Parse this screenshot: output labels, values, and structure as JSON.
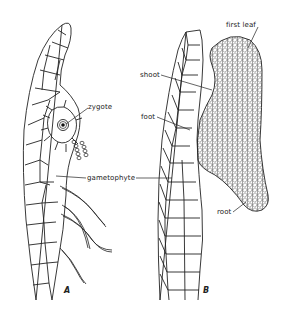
{
  "figure": {
    "title": "",
    "panels": [
      {
        "id": "A",
        "label": "A"
      },
      {
        "id": "B",
        "label": "B"
      }
    ],
    "labels": {
      "zygote": "zygote",
      "gametophyte": "gametophyte",
      "shoot": "shoot",
      "foot": "foot",
      "first_leaf": "first leaf",
      "root": "root"
    },
    "colors": {
      "ink": "#222222",
      "background": "#ffffff"
    }
  }
}
